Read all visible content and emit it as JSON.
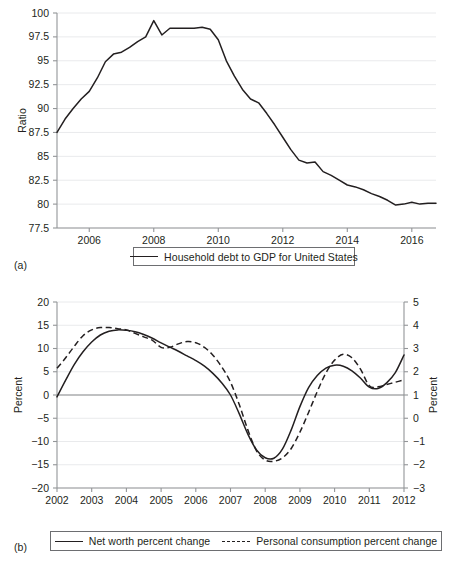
{
  "figures": [
    {
      "panel_label": "(a)",
      "legend": [
        {
          "label": "Household debt to GDP for United States",
          "style": "solid"
        }
      ]
    },
    {
      "panel_label": "(b)",
      "legend": [
        {
          "label": "Net worth percent change",
          "style": "solid"
        },
        {
          "label": "Personal consumption percent change",
          "style": "dashed"
        }
      ]
    }
  ],
  "chart_data": [
    {
      "type": "line",
      "panel": "(a)",
      "title": "",
      "xlabel": "",
      "ylabel": "Ratio",
      "xlim": [
        2005.0,
        2016.75
      ],
      "ylim": [
        77.5,
        100
      ],
      "grid": true,
      "legend_position": "bottom",
      "xticks": [
        "2006",
        "2008",
        "2010",
        "2012",
        "2014",
        "2016"
      ],
      "xtick_values": [
        2006,
        2008,
        2010,
        2012,
        2014,
        2016
      ],
      "yticks": [
        "77.5",
        "80",
        "82.5",
        "85",
        "87.5",
        "90",
        "92.5",
        "95",
        "97.5",
        "100"
      ],
      "ytick_values": [
        77.5,
        80,
        82.5,
        85,
        87.5,
        90,
        92.5,
        95,
        97.5,
        100
      ],
      "series": [
        {
          "name": "Household debt to GDP for United States",
          "style": "solid",
          "x": [
            2005.0,
            2005.25,
            2005.5,
            2005.75,
            2006.0,
            2006.25,
            2006.5,
            2006.75,
            2007.0,
            2007.25,
            2007.5,
            2007.75,
            2008.0,
            2008.25,
            2008.5,
            2008.75,
            2009.0,
            2009.25,
            2009.5,
            2009.75,
            2010.0,
            2010.25,
            2010.5,
            2010.75,
            2011.0,
            2011.25,
            2011.5,
            2011.75,
            2012.0,
            2012.25,
            2012.5,
            2012.75,
            2013.0,
            2013.25,
            2013.5,
            2013.75,
            2014.0,
            2014.25,
            2014.5,
            2014.75,
            2015.0,
            2015.25,
            2015.5,
            2015.75,
            2016.0,
            2016.25,
            2016.5,
            2016.75
          ],
          "y": [
            87.5,
            88.9,
            90.0,
            91.0,
            91.8,
            93.2,
            94.9,
            95.7,
            95.9,
            96.4,
            97.0,
            97.5,
            99.2,
            97.7,
            98.4,
            98.4,
            98.4,
            98.4,
            98.5,
            98.3,
            97.2,
            95.0,
            93.4,
            92.0,
            91.0,
            90.6,
            89.5,
            88.3,
            87.0,
            85.7,
            84.6,
            84.3,
            84.4,
            83.4,
            83.0,
            82.5,
            82.0,
            81.8,
            81.5,
            81.1,
            80.8,
            80.4,
            79.9,
            80.0,
            80.2,
            80.0,
            80.1,
            80.1
          ]
        }
      ]
    },
    {
      "type": "line",
      "panel": "(b)",
      "title": "",
      "xlabel": "",
      "ylabel": "Percent",
      "ylabel_right": "Percent",
      "xlim": [
        2002,
        2012
      ],
      "ylim": [
        -20,
        20
      ],
      "ylim_right": [
        -3,
        5
      ],
      "grid": true,
      "legend_position": "bottom",
      "xticks": [
        "2002",
        "2003",
        "2004",
        "2005",
        "2006",
        "2007",
        "2008",
        "2009",
        "2010",
        "2011",
        "2012"
      ],
      "xtick_values": [
        2002,
        2003,
        2004,
        2005,
        2006,
        2007,
        2008,
        2009,
        2010,
        2011,
        2012
      ],
      "yticks": [
        "-20",
        "-15",
        "-10",
        "-5",
        "0",
        "5",
        "10",
        "15",
        "20"
      ],
      "ytick_values": [
        -20,
        -15,
        -10,
        -5,
        0,
        5,
        10,
        15,
        20
      ],
      "yticks_right": [
        "-3",
        "-2",
        "-1",
        "0",
        "1",
        "2",
        "3",
        "4",
        "5"
      ],
      "ytick_values_right": [
        -3,
        -2,
        -1,
        0,
        1,
        2,
        3,
        4,
        5
      ],
      "series": [
        {
          "name": "Net worth percent change",
          "style": "solid",
          "axis": "left",
          "x": [
            2002.0,
            2002.25,
            2002.5,
            2002.75,
            2003.0,
            2003.25,
            2003.5,
            2003.75,
            2004.0,
            2004.25,
            2004.5,
            2004.75,
            2005.0,
            2005.25,
            2005.5,
            2005.75,
            2006.0,
            2006.25,
            2006.5,
            2006.75,
            2007.0,
            2007.25,
            2007.5,
            2007.75,
            2008.0,
            2008.25,
            2008.5,
            2008.75,
            2009.0,
            2009.25,
            2009.5,
            2009.75,
            2010.0,
            2010.25,
            2010.5,
            2010.75,
            2011.0,
            2011.25,
            2011.5,
            2011.75,
            2012.0
          ],
          "y": [
            -0.4,
            3.2,
            6.6,
            9.3,
            11.4,
            12.9,
            13.7,
            14.0,
            13.9,
            13.6,
            13.0,
            12.2,
            11.2,
            10.3,
            9.4,
            8.4,
            7.4,
            6.2,
            4.6,
            2.6,
            0.0,
            -4.0,
            -8.4,
            -11.8,
            -13.5,
            -13.6,
            -11.6,
            -7.5,
            -2.5,
            1.6,
            4.2,
            5.8,
            6.4,
            6.2,
            5.2,
            3.6,
            1.7,
            1.4,
            2.6,
            4.8,
            8.6
          ]
        },
        {
          "name": "Personal consumption percent change",
          "style": "dashed",
          "axis": "right",
          "x": [
            2002.0,
            2002.25,
            2002.5,
            2002.75,
            2003.0,
            2003.25,
            2003.5,
            2003.75,
            2004.0,
            2004.25,
            2004.5,
            2004.75,
            2005.0,
            2005.25,
            2005.5,
            2005.75,
            2006.0,
            2006.25,
            2006.5,
            2006.75,
            2007.0,
            2007.25,
            2007.5,
            2007.75,
            2008.0,
            2008.25,
            2008.5,
            2008.75,
            2009.0,
            2009.25,
            2009.5,
            2009.75,
            2010.0,
            2010.25,
            2010.5,
            2010.75,
            2011.0,
            2011.25,
            2011.5,
            2011.75,
            2012.0
          ],
          "y": [
            2.15,
            2.6,
            3.1,
            3.55,
            3.8,
            3.9,
            3.9,
            3.85,
            3.8,
            3.65,
            3.5,
            3.35,
            3.05,
            3.05,
            3.2,
            3.3,
            3.25,
            3.05,
            2.7,
            2.2,
            1.55,
            0.6,
            -0.5,
            -1.4,
            -1.8,
            -1.85,
            -1.7,
            -1.3,
            -0.6,
            0.25,
            1.15,
            1.95,
            2.5,
            2.75,
            2.6,
            2.1,
            1.4,
            1.35,
            1.45,
            1.55,
            1.65
          ]
        }
      ]
    }
  ]
}
